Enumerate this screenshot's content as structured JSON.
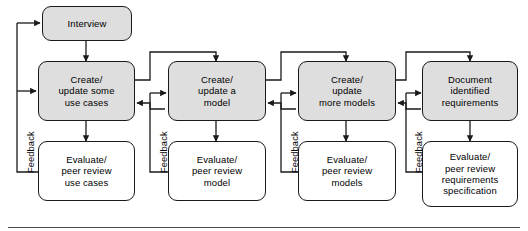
{
  "diagram": {
    "bottom_rule": true,
    "columns": [
      {
        "id": "col1",
        "create_box": "Create/\nupdate some\nuse cases",
        "evaluate_box": "Evaluate/\npeer review\nuse cases",
        "feedback_label": "Feedback"
      },
      {
        "id": "col2",
        "create_box": "Create/\nupdate a\nmodel",
        "evaluate_box": "Evaluate/\npeer review\nmodel",
        "feedback_label": "Feedback"
      },
      {
        "id": "col3",
        "create_box": "Create/\nupdate\nmore models",
        "evaluate_box": "Evaluate/\npeer review\nmodels",
        "feedback_label": "Feedback"
      },
      {
        "id": "col4",
        "create_box": "Document\nidentified\nrequirements",
        "evaluate_box": "Evaluate/\npeer review\nrequirements\nspecification",
        "feedback_label": "Feedback"
      }
    ],
    "start_node": "Interview",
    "colors": {
      "process_fill": "#dedede",
      "review_fill": "#ffffff",
      "stroke": "#1a1a1a",
      "rule": "#4a4a4a"
    }
  }
}
